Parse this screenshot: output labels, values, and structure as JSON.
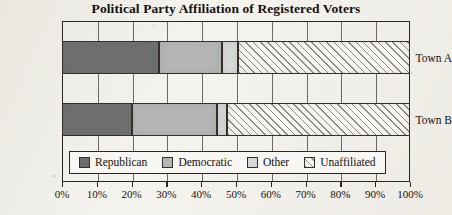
{
  "chart_data": {
    "type": "bar",
    "orientation": "horizontal",
    "stacked": true,
    "stack_mode": "percent",
    "title": "Political Party Affiliation of Registered Voters",
    "xlabel": "",
    "ylabel": "",
    "xlim": [
      0,
      100
    ],
    "grid": true,
    "legend_position": "bottom-inside-left",
    "categories": [
      "Town A",
      "Town B"
    ],
    "xticks": [
      0,
      10,
      20,
      30,
      40,
      50,
      60,
      70,
      80,
      90,
      100
    ],
    "xtick_labels": [
      "0%",
      "10%",
      "20%",
      "30%",
      "40%",
      "50%",
      "60%",
      "70%",
      "80%",
      "90%",
      "100%"
    ],
    "series": [
      {
        "name": "Republican",
        "color": "#6e6e6e",
        "pattern": "solid",
        "values": [
          28,
          20
        ]
      },
      {
        "name": "Democratic",
        "color": "#b5b5b5",
        "pattern": "solid",
        "values": [
          18,
          24.5
        ]
      },
      {
        "name": "Other",
        "color": "#d8d8d8",
        "pattern": "solid",
        "values": [
          4.5,
          3
        ]
      },
      {
        "name": "Unaffiliated",
        "color": "#f7f6f3",
        "pattern": "diagonal-hatch",
        "values": [
          49.5,
          52.5
        ]
      }
    ]
  },
  "axis": {
    "tick_labels": [
      "0%",
      "10%",
      "20%",
      "30%",
      "40%",
      "50%",
      "60%",
      "70%",
      "80%",
      "90%",
      "100%"
    ]
  },
  "legend": {
    "items": [
      {
        "label": "Republican"
      },
      {
        "label": "Democratic"
      },
      {
        "label": "Other"
      },
      {
        "label": "Unaffiliated"
      }
    ]
  },
  "categories": [
    {
      "label": "Town A"
    },
    {
      "label": "Town B"
    }
  ]
}
